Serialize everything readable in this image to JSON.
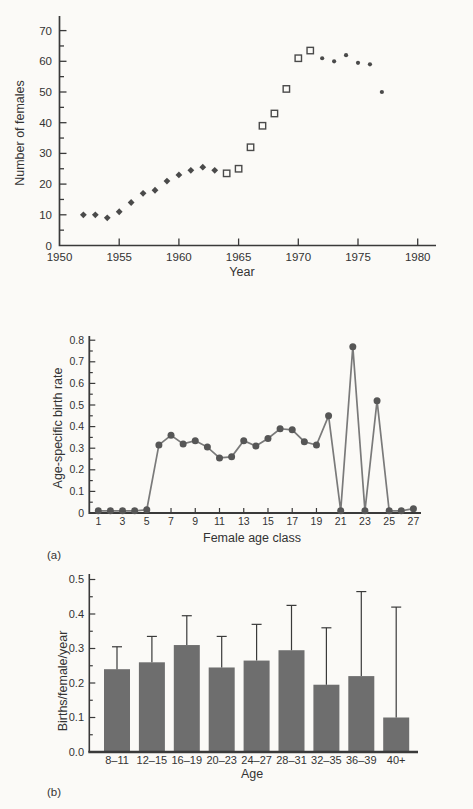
{
  "colors": {
    "background": "#fbfaf7",
    "axis": "#3a3a3a",
    "text": "#333333",
    "scatter_marker": "#4a4a4a",
    "line": "#7a7a7a",
    "line_marker": "#565656",
    "bar": "#6e6e6e",
    "error_bar": "#3a3a3a"
  },
  "chart_data": [
    {
      "id": "population-scatter",
      "type": "scatter",
      "title": "",
      "xlabel": "Year",
      "ylabel": "Number of females",
      "xlim": [
        1950,
        1982
      ],
      "ylim": [
        0,
        72
      ],
      "xticks": [
        1950,
        1955,
        1960,
        1965,
        1970,
        1975,
        1980
      ],
      "yticks": [
        0,
        10,
        20,
        30,
        40,
        50,
        60,
        70
      ],
      "grid": false,
      "legend": false,
      "series": [
        {
          "name": "early-counts-filled-diamonds",
          "marker": "diamond",
          "x": [
            1952,
            1953,
            1954,
            1955,
            1956,
            1957,
            1958,
            1959,
            1960,
            1961,
            1962,
            1963
          ],
          "y": [
            10,
            10,
            9,
            11,
            14,
            17,
            18,
            21,
            23,
            24.5,
            25.5,
            24.5
          ]
        },
        {
          "name": "mid-counts-open-squares",
          "marker": "open-square",
          "x": [
            1964,
            1965,
            1966,
            1967,
            1968,
            1969,
            1970,
            1971
          ],
          "y": [
            23.5,
            25,
            32,
            39,
            43,
            51,
            61,
            63.5
          ]
        },
        {
          "name": "late-counts-small-dots",
          "marker": "dot",
          "x": [
            1972,
            1973,
            1974,
            1975,
            1976,
            1977
          ],
          "y": [
            61,
            60,
            62,
            59.5,
            59,
            50
          ]
        }
      ]
    },
    {
      "id": "age-specific-birth-rate",
      "type": "line",
      "panel_label": "(a)",
      "title": "",
      "xlabel": "Female age class",
      "ylabel": "Age-specific birth rate",
      "xlim": [
        1,
        27
      ],
      "ylim": [
        0,
        0.8
      ],
      "xticks": [
        1,
        3,
        5,
        7,
        9,
        11,
        13,
        15,
        17,
        19,
        21,
        23,
        25,
        27
      ],
      "yticks": [
        0,
        0.1,
        0.2,
        0.3,
        0.4,
        0.5,
        0.6,
        0.7,
        0.8
      ],
      "grid": false,
      "legend": false,
      "x": [
        1,
        2,
        3,
        4,
        5,
        6,
        7,
        8,
        9,
        10,
        11,
        12,
        13,
        14,
        15,
        16,
        17,
        18,
        19,
        20,
        21,
        22,
        23,
        24,
        25,
        26,
        27
      ],
      "y": [
        0.01,
        0.01,
        0.01,
        0.01,
        0.015,
        0.315,
        0.36,
        0.32,
        0.335,
        0.305,
        0.255,
        0.26,
        0.335,
        0.31,
        0.345,
        0.39,
        0.385,
        0.33,
        0.315,
        0.45,
        0.01,
        0.77,
        0.01,
        0.52,
        0.01,
        0.01,
        0.02
      ]
    },
    {
      "id": "births-per-female-per-year",
      "type": "bar",
      "panel_label": "(b)",
      "title": "",
      "xlabel": "Age",
      "ylabel": "Births/female/year",
      "ylim": [
        0,
        0.5
      ],
      "yticks": [
        0,
        0.1,
        0.2,
        0.3,
        0.4,
        0.5
      ],
      "grid": false,
      "legend": false,
      "categories": [
        "8–11",
        "12–15",
        "16–19",
        "20–23",
        "24–27",
        "28–31",
        "32–35",
        "36–39",
        "40+"
      ],
      "values": [
        0.24,
        0.26,
        0.31,
        0.245,
        0.265,
        0.295,
        0.195,
        0.22,
        0.1
      ],
      "error_upper": [
        0.305,
        0.335,
        0.395,
        0.335,
        0.37,
        0.425,
        0.36,
        0.465,
        0.42
      ]
    }
  ]
}
